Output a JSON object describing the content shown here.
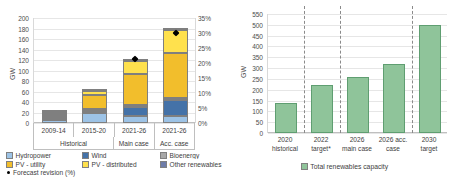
{
  "chart_data": [
    {
      "type": "bar",
      "id": "left-stacked-bar",
      "title": "",
      "ylabel": "GW",
      "ylim": [
        0,
        200
      ],
      "yticks": [
        "0",
        "20",
        "40",
        "60",
        "80",
        "100",
        "120",
        "140",
        "160",
        "180",
        "200"
      ],
      "y2lim": [
        0,
        35
      ],
      "y2ticks": [
        "0%",
        "5%",
        "10%",
        "15%",
        "20%",
        "25%",
        "30%",
        "35%"
      ],
      "categories": [
        "2009-14",
        "2015-20",
        "2021-26",
        "2021-26"
      ],
      "group_labels": [
        "Historical",
        "Main case",
        "Acc. case"
      ],
      "series": [
        {
          "name": "Hydropower",
          "color": "#9DC3E6",
          "values": [
            15.5,
            23.0,
            13.0,
            13.5
          ]
        },
        {
          "name": "Wind",
          "color": "#4472A8",
          "values": [
            4.5,
            2.0,
            18.5,
            32.0
          ]
        },
        {
          "name": "Bioenergy",
          "color": "#A8A8A8",
          "values": [
            1.0,
            1.0,
            1.0,
            1.0
          ]
        },
        {
          "name": "PV - utility",
          "color": "#F2BE2C",
          "values": [
            2.0,
            29.0,
            62.0,
            89.0
          ]
        },
        {
          "name": "PV - distributed",
          "color": "#FFE14D",
          "values": [
            1.0,
            9.0,
            27.0,
            45.0
          ]
        },
        {
          "name": "Other renewables",
          "color": "#6E7CA8",
          "values": [
            0.5,
            0.5,
            0.5,
            0.5
          ]
        }
      ],
      "totals": [
        24.5,
        64.5,
        122.0,
        181.0
      ],
      "marker_series": {
        "name": "Forecast revision (%)",
        "color": "#000000",
        "values": [
          null,
          null,
          21.5,
          30.0
        ]
      },
      "legend": [
        {
          "label": "Hydropower",
          "color": "#9DC3E6"
        },
        {
          "label": "Wind",
          "color": "#4472A8"
        },
        {
          "label": "Bioenergy",
          "color": "#A8A8A8"
        },
        {
          "label": "PV - utility",
          "color": "#F2BE2C"
        },
        {
          "label": "PV - distributed",
          "color": "#FFE14D"
        },
        {
          "label": "Other renewables",
          "color": "#6E7CA8"
        },
        {
          "label": "Forecast revision (%)",
          "color": "#000000"
        }
      ]
    },
    {
      "type": "bar",
      "id": "right-bar",
      "title": "",
      "ylabel": "GW",
      "ylim": [
        0,
        550
      ],
      "yticks": [
        "0",
        "50",
        "100",
        "150",
        "200",
        "250",
        "300",
        "350",
        "400",
        "450",
        "500",
        "550"
      ],
      "categories": [
        "2020 historical",
        "2022 target*",
        "2026 main case",
        "2026 acc. case",
        "2030 target"
      ],
      "category_lines": [
        [
          "2020",
          "historical"
        ],
        [
          "2022",
          "target*"
        ],
        [
          "2026",
          "main case"
        ],
        [
          "2026 acc.",
          "case"
        ],
        [
          "2030",
          "target"
        ]
      ],
      "values": [
        140,
        221,
        259,
        321,
        497
      ],
      "bar_color": "#8FC49A",
      "legend": [
        {
          "label": "Total renewables capacity",
          "color": "#8FC49A"
        }
      ],
      "dividers_after": [
        1,
        2,
        4
      ]
    }
  ],
  "left": {
    "ylabel": "GW",
    "yticks": [
      "200",
      "180",
      "160",
      "140",
      "120",
      "100",
      "80",
      "60",
      "40",
      "20",
      "0"
    ],
    "y2ticks": [
      "35%",
      "30%",
      "25%",
      "20%",
      "15%",
      "10%",
      "5%",
      "0%"
    ],
    "categories": [
      "2009-14",
      "2015-20",
      "2021-26",
      "2021-26"
    ],
    "groups": [
      "Historical",
      "Main case",
      "Acc. case"
    ],
    "legend": {
      "hydropower": "Hydropower",
      "wind": "Wind",
      "bioenergy": "Bioenergy",
      "pv_utility": "PV - utility",
      "pv_distributed": "PV - distributed",
      "other": "Other renewables",
      "forecast": "Forecast revision (%)"
    }
  },
  "right": {
    "ylabel": "GW",
    "yticks": [
      "550",
      "500",
      "450",
      "400",
      "350",
      "300",
      "250",
      "200",
      "150",
      "100",
      "50",
      "0"
    ],
    "cat1": [
      "2020",
      "2022",
      "2026",
      "2026 acc.",
      "2030"
    ],
    "cat2": [
      "historical",
      "target*",
      "main case",
      "case",
      "target"
    ],
    "legend_label": "Total renewables capacity"
  }
}
